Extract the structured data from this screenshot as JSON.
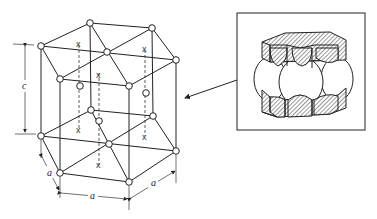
{
  "figure": {
    "labels": {
      "height": "c",
      "edge_left": "a",
      "edge_front": "a",
      "edge_right": "a"
    },
    "interstitial_marker": "x",
    "inset": {
      "description": "hard-sphere model of HCP cell"
    }
  }
}
